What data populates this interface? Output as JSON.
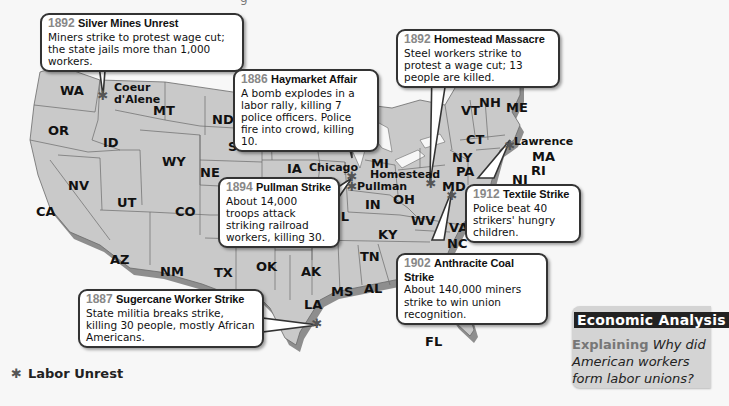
{
  "map": {
    "colors": {
      "land": "#c9c9c9",
      "land_shadow": "#8e8e8e",
      "border": "#6a6a6a",
      "background": "#f7f7f7",
      "star": "#555555",
      "callout_border": "#333333",
      "year_text": "#888888"
    },
    "top_cut_text": "...g... (truncated text above frame)",
    "states": [
      {
        "abbr": "WA"
      },
      {
        "abbr": "OR"
      },
      {
        "abbr": "CA"
      },
      {
        "abbr": "ID"
      },
      {
        "abbr": "NV"
      },
      {
        "abbr": "MT"
      },
      {
        "abbr": "WY"
      },
      {
        "abbr": "UT"
      },
      {
        "abbr": "AZ"
      },
      {
        "abbr": "CO"
      },
      {
        "abbr": "NM"
      },
      {
        "abbr": "ND"
      },
      {
        "abbr": "SD"
      },
      {
        "abbr": "NE"
      },
      {
        "abbr": "KS"
      },
      {
        "abbr": "OK"
      },
      {
        "abbr": "TX"
      },
      {
        "abbr": "MN"
      },
      {
        "abbr": "IA"
      },
      {
        "abbr": "MO"
      },
      {
        "abbr": "AK"
      },
      {
        "abbr": "LA"
      },
      {
        "abbr": "WI"
      },
      {
        "abbr": "IL"
      },
      {
        "abbr": "MI"
      },
      {
        "abbr": "IN"
      },
      {
        "abbr": "OH"
      },
      {
        "abbr": "KY"
      },
      {
        "abbr": "TN"
      },
      {
        "abbr": "MS"
      },
      {
        "abbr": "AL"
      },
      {
        "abbr": "GA"
      },
      {
        "abbr": "FL"
      },
      {
        "abbr": "WV"
      },
      {
        "abbr": "VA"
      },
      {
        "abbr": "NC"
      },
      {
        "abbr": "PA"
      },
      {
        "abbr": "NY"
      },
      {
        "abbr": "MD"
      },
      {
        "abbr": "NJ"
      },
      {
        "abbr": "CT"
      },
      {
        "abbr": "RI"
      },
      {
        "abbr": "MA"
      },
      {
        "abbr": "VT"
      },
      {
        "abbr": "NH"
      },
      {
        "abbr": "ME"
      }
    ],
    "cities": {
      "coeur_dalene_1": "Coeur",
      "coeur_dalene_2": "d'Alene",
      "chicago": "Chicago",
      "pullman": "Pullman",
      "homestead": "Homestead",
      "lawrence": "Lawrence"
    },
    "events": [
      {
        "year": "1892",
        "title": "Silver Mines Unrest",
        "description": "Miners strike to protest wage cut; the state jails more than 1,000 workers.",
        "location": "Coeur d'Alene"
      },
      {
        "year": "1886",
        "title": "Haymarket Affair",
        "description": "A bomb explodes in a labor rally, killing 7 police officers. Police fire into crowd, killing 10.",
        "location": "Chicago"
      },
      {
        "year": "1892",
        "title": "Homestead Massacre",
        "description": "Steel workers strike to protest a wage cut; 13 people are killed.",
        "location": "Homestead"
      },
      {
        "year": "1894",
        "title": "Pullman Strike",
        "description": "About 14,000 troops attack striking railroad workers, killing 30.",
        "location": "Pullman"
      },
      {
        "year": "1912",
        "title": "Textile Strike",
        "description": "Police beat 40 strikers' hungry children.",
        "location": "Lawrence"
      },
      {
        "year": "1902",
        "title": "Anthracite Coal Strike",
        "description": "About 140,000 miners strike to win union recognition.",
        "location": "Pennsylvania"
      },
      {
        "year": "1887",
        "title": "Sugercane Worker Strike",
        "description": "State militia breaks strike, killing 30 people, mostly African Americans.",
        "location": "Louisiana"
      }
    ],
    "legend": {
      "symbol": "✱",
      "label": "Labor Unrest"
    }
  },
  "economic_analysis": {
    "title": "Economic Analysis",
    "keyword": "Explaining",
    "question": "Why did American workers form labor unions?"
  }
}
